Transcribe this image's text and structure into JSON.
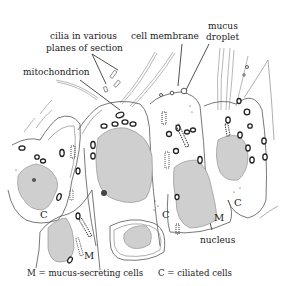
{
  "figure": {
    "type": "biology-diagram",
    "colors": {
      "background": "#ffffff",
      "nucleus_fill": "#cfcfcf",
      "line": "#555555",
      "text": "#222222"
    }
  },
  "labels": {
    "cilia": [
      "cilia in various",
      "planes of section"
    ],
    "cell_membrane": "cell membrane",
    "mucus_droplet": [
      "mucus",
      "droplet"
    ],
    "mitochondrion": "mitochondrion",
    "nucleus": "nucleus"
  },
  "cell_markers": {
    "c_left": "C",
    "m_left": "M",
    "c_center": "C",
    "m_center": "M",
    "c_right": "C"
  },
  "legend": {
    "m": "M = mucus-secreting cells",
    "c": "C = ciliated cells"
  }
}
